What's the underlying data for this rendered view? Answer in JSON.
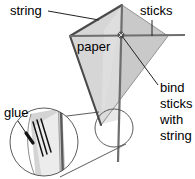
{
  "diagram": {
    "background_color": "#ffffff",
    "colors": {
      "paper_left_fill": "#d4d4d4",
      "paper_right_fill": "#c9c9c9",
      "paper_highlight_fill": "#e4e4e4",
      "outline": "#555555",
      "string_edge": "#4a4a4a",
      "stick": "#666666",
      "leader_line": "#333333",
      "glue_stroke": "#1a1a1a",
      "text": "#000000"
    },
    "labels": [
      {
        "id": "string",
        "text": "string",
        "x": 10,
        "y": 15,
        "anchor": "start",
        "leader_from": [
          48,
          11
        ],
        "leader_to": [
          99,
          20
        ]
      },
      {
        "id": "sticks",
        "text": "sticks",
        "x": 140,
        "y": 15,
        "anchor": "start",
        "leader_from": [
          152,
          20
        ],
        "leader_to": [
          152,
          36
        ]
      },
      {
        "id": "paper",
        "text": "paper",
        "x": 77,
        "y": 51,
        "anchor": "start",
        "leader_from": null,
        "leader_to": null
      },
      {
        "id": "glue",
        "text": "glue",
        "x": 4,
        "y": 117,
        "anchor": "start",
        "leader_from": [
          18,
          121
        ],
        "leader_to": [
          29,
          139
        ]
      }
    ],
    "callout": {
      "id": "bind-sticks-with-string",
      "lines": [
        "bind",
        "sticks",
        "with",
        "string"
      ],
      "x": 160,
      "y_start": 92,
      "line_height": 16,
      "anchor": "start",
      "leader_from": [
        158,
        85
      ],
      "leader_to": [
        121,
        35
      ]
    },
    "kite": {
      "top_vertex": [
        122,
        5
      ],
      "left_vertex": [
        70,
        36
      ],
      "bottom_vertex": [
        101,
        125
      ],
      "right_vertex": [
        168,
        36
      ],
      "spine_top": [
        122,
        5
      ],
      "spine_bottom": [
        118,
        160
      ],
      "cross_stick_left": [
        70,
        36
      ],
      "cross_stick_right": [
        168,
        36
      ],
      "bind_point": [
        121,
        35
      ]
    },
    "magnifier": {
      "source_circle": {
        "cx": 114,
        "cy": 128,
        "r": 19
      },
      "detail_circle": {
        "cx": 44,
        "cy": 142,
        "r": 34
      },
      "connector_top": [
        [
          98,
          112
        ],
        [
          20,
          122
        ]
      ],
      "connector_bottom": [
        [
          125,
          145
        ],
        [
          58,
          176
        ]
      ],
      "glue_strokes": 3
    }
  }
}
